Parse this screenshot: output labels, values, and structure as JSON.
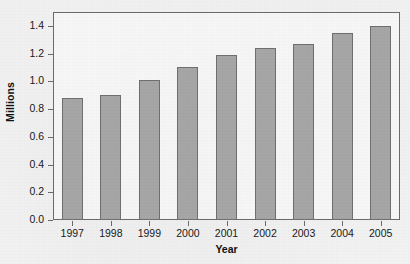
{
  "chart_data": {
    "type": "bar",
    "title": "",
    "subtitle": "",
    "xlabel": "Year",
    "ylabel": "Millions",
    "categories": [
      "1997",
      "1998",
      "1999",
      "2000",
      "2001",
      "2002",
      "2003",
      "2004",
      "2005"
    ],
    "values": [
      0.88,
      0.9,
      1.01,
      1.1,
      1.19,
      1.24,
      1.27,
      1.35,
      1.4
    ],
    "series": [
      {
        "name": "Millions",
        "values": [
          0.88,
          0.9,
          1.01,
          1.1,
          1.19,
          1.24,
          1.27,
          1.35,
          1.4
        ]
      }
    ],
    "ylim": [
      0.0,
      1.5
    ],
    "yticks": [
      0.0,
      0.2,
      0.4,
      0.6,
      0.8,
      1.0,
      1.2,
      1.4
    ],
    "ytick_labels": [
      "0.0",
      "0.2",
      "0.4",
      "0.6",
      "0.8",
      "1.0",
      "1.2",
      "1.4"
    ],
    "xtick_labels": [
      "1997",
      "1998",
      "1999",
      "2000",
      "2001",
      "2002",
      "2003",
      "2004",
      "2005"
    ],
    "grid": false,
    "legend": false,
    "legend_position": "none",
    "annotations": [],
    "colors": {
      "bar_fill": "#a6a6a6",
      "bar_edge": "#6f6f6f",
      "axis": "#6b6b6b",
      "text": "#1a1a1a",
      "background": "#f4f4f4",
      "plot_background": "#fbfbfb"
    }
  }
}
